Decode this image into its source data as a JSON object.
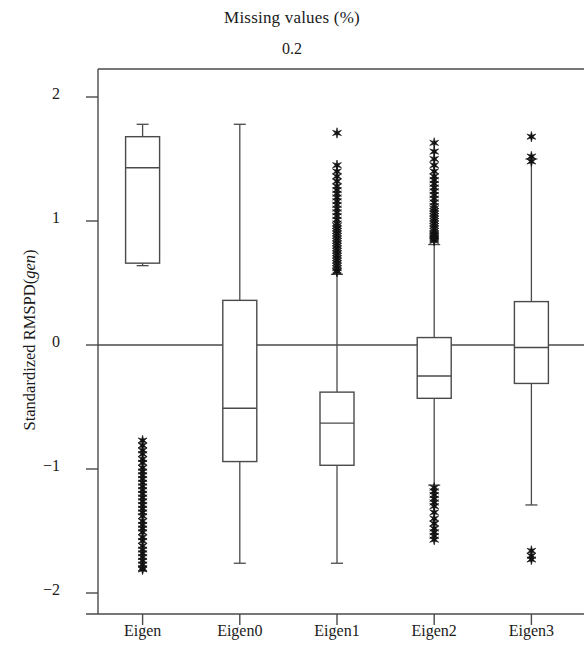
{
  "chart_data": {
    "type": "box",
    "title": "Missing values (%)",
    "subtitle": "0.2",
    "xlabel": "",
    "ylabel_prefix": "Standardized RMSPD(",
    "ylabel_italic": "gen",
    "ylabel_suffix": ")",
    "ylim": [
      -2.3,
      2.25
    ],
    "yticks": [
      2,
      1,
      0,
      -1,
      -2
    ],
    "ytick_labels": [
      "2",
      "1",
      "0",
      "−1",
      "−2"
    ],
    "grid": false,
    "legend": null,
    "reference_line_y": 0,
    "categories": [
      "Eigen",
      "Eigen0",
      "Eigen1",
      "Eigen2",
      "Eigen3"
    ],
    "boxes": [
      {
        "category": "Eigen",
        "whisker_high": 1.78,
        "q3": 1.68,
        "median": 1.43,
        "q1": 0.66,
        "whisker_low": 0.64,
        "outliers_high": [],
        "outliers_low": [
          -0.77,
          -0.81,
          -0.85,
          -0.88,
          -0.92,
          -0.95,
          -0.99,
          -1.02,
          -1.05,
          -1.08,
          -1.11,
          -1.14,
          -1.17,
          -1.2,
          -1.23,
          -1.26,
          -1.29,
          -1.32,
          -1.35,
          -1.38,
          -1.42,
          -1.45,
          -1.48,
          -1.51,
          -1.55,
          -1.58,
          -1.62,
          -1.65,
          -1.68,
          -1.71,
          -1.74,
          -1.77,
          -1.8,
          -1.81
        ]
      },
      {
        "category": "Eigen0",
        "whisker_high": 1.78,
        "q3": 0.36,
        "median": -0.51,
        "q1": -0.94,
        "whisker_low": -1.76,
        "outliers_high": [],
        "outliers_low": []
      },
      {
        "category": "Eigen1",
        "whisker_high": 0.57,
        "q3": -0.38,
        "median": -0.63,
        "q1": -0.97,
        "whisker_low": -1.76,
        "outliers_high": [
          1.71,
          1.45,
          1.4,
          1.36,
          1.32,
          1.28,
          1.25,
          1.22,
          1.19,
          1.16,
          1.13,
          1.1,
          1.07,
          1.04,
          1.01,
          0.98,
          0.96,
          0.94,
          0.92,
          0.9,
          0.88,
          0.86,
          0.84,
          0.82,
          0.8,
          0.78,
          0.76,
          0.74,
          0.72,
          0.7,
          0.68,
          0.66,
          0.64,
          0.62,
          0.6,
          0.59
        ],
        "outliers_low": []
      },
      {
        "category": "Eigen2",
        "whisker_high": 0.81,
        "q3": 0.06,
        "median": -0.25,
        "q1": -0.43,
        "whisker_low": -1.13,
        "outliers_high": [
          1.63,
          1.56,
          1.5,
          1.45,
          1.4,
          1.36,
          1.33,
          1.3,
          1.27,
          1.24,
          1.21,
          1.18,
          1.15,
          1.12,
          1.1,
          1.08,
          1.06,
          1.04,
          1.02,
          1.0,
          0.98,
          0.96,
          0.94,
          0.92,
          0.9,
          0.89,
          0.88,
          0.87,
          0.86,
          0.85,
          0.84
        ],
        "outliers_low": [
          -1.15,
          -1.18,
          -1.21,
          -1.24,
          -1.27,
          -1.3,
          -1.35,
          -1.4,
          -1.44,
          -1.48,
          -1.51,
          -1.54,
          -1.57
        ]
      },
      {
        "category": "Eigen3",
        "whisker_high": 1.5,
        "q3": 0.35,
        "median": -0.02,
        "q1": -0.31,
        "whisker_low": -1.29,
        "outliers_high": [
          1.68,
          1.52,
          1.48
        ],
        "outliers_low": [
          -1.66,
          -1.7,
          -1.73
        ]
      }
    ]
  },
  "axis": {
    "ytick_labels": [
      "2",
      "1",
      "0",
      "−1",
      "−2"
    ],
    "xtick_labels": [
      "Eigen",
      "Eigen0",
      "Eigen1",
      "Eigen2",
      "Eigen3"
    ]
  }
}
